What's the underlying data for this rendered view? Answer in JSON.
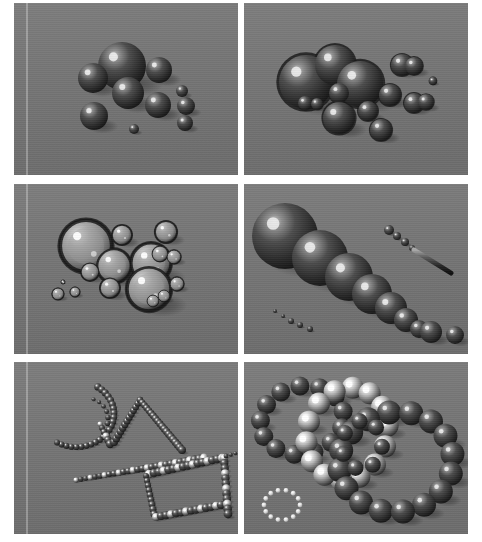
{
  "sheet": {
    "width": 482,
    "height": 542,
    "background": "#ffffff",
    "gutter_color": "#ffffff",
    "plate_color": "#767676",
    "plate_color_dark": "#6b6b6b",
    "rows": 3,
    "columns": 2,
    "caption": ""
  },
  "palette": {
    "background_gray": "#767676",
    "sphere_dark": "#2a2a2a",
    "sphere_mid": "#5a5a5a",
    "sphere_highlight": "#e8e8e8",
    "glass_rim": "#1e1e1e",
    "glass_body": "#8c8c8c",
    "shadow": "#4a4a4a",
    "bead_white": "#f0f0f0"
  },
  "panels": [
    {
      "id": "panel-1",
      "name": "opaque-spheres-cluster",
      "label": "",
      "x": 14,
      "y": 3,
      "w": 224,
      "h": 172,
      "edge_stripe_x": 12,
      "style": "opaque",
      "light": {
        "x": -0.35,
        "y": -0.45
      },
      "objects": [
        {
          "cx": 108,
          "cy": 63,
          "r": 24,
          "tone": "dark"
        },
        {
          "cx": 79,
          "cy": 75,
          "r": 15,
          "tone": "dark"
        },
        {
          "cx": 114,
          "cy": 90,
          "r": 16,
          "tone": "dark"
        },
        {
          "cx": 145,
          "cy": 67,
          "r": 13,
          "tone": "dark"
        },
        {
          "cx": 144,
          "cy": 102,
          "r": 13,
          "tone": "dark"
        },
        {
          "cx": 80,
          "cy": 113,
          "r": 14,
          "tone": "dark"
        },
        {
          "cx": 168,
          "cy": 88,
          "r": 6,
          "tone": "dark"
        },
        {
          "cx": 172,
          "cy": 103,
          "r": 9,
          "tone": "dark"
        },
        {
          "cx": 171,
          "cy": 120,
          "r": 8,
          "tone": "dark"
        },
        {
          "cx": 120,
          "cy": 126,
          "r": 5,
          "tone": "dark"
        }
      ]
    },
    {
      "id": "panel-2",
      "name": "merged-blobs-cluster",
      "label": "",
      "x": 244,
      "y": 3,
      "w": 224,
      "h": 172,
      "edge_stripe_x": -1,
      "style": "blobby",
      "light": {
        "x": -0.3,
        "y": -0.4
      },
      "objects": [
        {
          "cx": 62,
          "cy": 79,
          "r": 27,
          "tone": "dark"
        },
        {
          "cx": 91,
          "cy": 62,
          "r": 20,
          "tone": "dark"
        },
        {
          "cx": 116,
          "cy": 81,
          "r": 23,
          "tone": "dark"
        },
        {
          "cx": 95,
          "cy": 90,
          "r": 10,
          "tone": "dark"
        },
        {
          "cx": 61,
          "cy": 100,
          "r": 7,
          "tone": "dark"
        },
        {
          "cx": 73,
          "cy": 101,
          "r": 6,
          "tone": "dark"
        },
        {
          "cx": 95,
          "cy": 115,
          "r": 16,
          "tone": "dark"
        },
        {
          "cx": 124,
          "cy": 108,
          "r": 10,
          "tone": "dark"
        },
        {
          "cx": 137,
          "cy": 127,
          "r": 11,
          "tone": "dark"
        },
        {
          "cx": 146,
          "cy": 92,
          "r": 11,
          "tone": "dark"
        },
        {
          "cx": 158,
          "cy": 62,
          "r": 11,
          "tone": "dark"
        },
        {
          "cx": 170,
          "cy": 63,
          "r": 9,
          "tone": "dark"
        },
        {
          "cx": 170,
          "cy": 100,
          "r": 10,
          "tone": "dark"
        },
        {
          "cx": 182,
          "cy": 99,
          "r": 8,
          "tone": "dark"
        },
        {
          "cx": 189,
          "cy": 78,
          "r": 4,
          "tone": "dark"
        }
      ]
    },
    {
      "id": "panel-3",
      "name": "transparent-bubbles-cluster",
      "label": "",
      "x": 14,
      "y": 184,
      "w": 224,
      "h": 170,
      "edge_stripe_x": 12,
      "style": "glass",
      "light": {
        "x": -0.3,
        "y": -0.45
      },
      "objects": [
        {
          "cx": 72,
          "cy": 62,
          "r": 26,
          "tone": "glass"
        },
        {
          "cx": 100,
          "cy": 82,
          "r": 17,
          "tone": "glass"
        },
        {
          "cx": 76,
          "cy": 88,
          "r": 9,
          "tone": "glass"
        },
        {
          "cx": 96,
          "cy": 104,
          "r": 10,
          "tone": "glass"
        },
        {
          "cx": 137,
          "cy": 79,
          "r": 20,
          "tone": "glass"
        },
        {
          "cx": 135,
          "cy": 105,
          "r": 22,
          "tone": "glass"
        },
        {
          "cx": 108,
          "cy": 51,
          "r": 10,
          "tone": "glass"
        },
        {
          "cx": 152,
          "cy": 48,
          "r": 11,
          "tone": "glass"
        },
        {
          "cx": 146,
          "cy": 70,
          "r": 8,
          "tone": "glass"
        },
        {
          "cx": 160,
          "cy": 73,
          "r": 7,
          "tone": "glass"
        },
        {
          "cx": 163,
          "cy": 100,
          "r": 7,
          "tone": "glass"
        },
        {
          "cx": 150,
          "cy": 112,
          "r": 6,
          "tone": "glass"
        },
        {
          "cx": 139,
          "cy": 117,
          "r": 6,
          "tone": "glass"
        },
        {
          "cx": 44,
          "cy": 110,
          "r": 6,
          "tone": "glass"
        },
        {
          "cx": 61,
          "cy": 108,
          "r": 5,
          "tone": "glass"
        },
        {
          "cx": 49,
          "cy": 98,
          "r": 2,
          "tone": "glass"
        }
      ]
    },
    {
      "id": "panel-4",
      "name": "tapered-sphere-chain",
      "label": "",
      "x": 244,
      "y": 184,
      "w": 224,
      "h": 170,
      "edge_stripe_x": -1,
      "style": "opaque",
      "light": {
        "x": -0.3,
        "y": -0.45
      },
      "objects": [
        {
          "cx": 41,
          "cy": 52,
          "r": 33,
          "tone": "dark"
        },
        {
          "cx": 76,
          "cy": 74,
          "r": 28,
          "tone": "dark"
        },
        {
          "cx": 105,
          "cy": 93,
          "r": 24,
          "tone": "dark"
        },
        {
          "cx": 128,
          "cy": 110,
          "r": 20,
          "tone": "dark"
        },
        {
          "cx": 147,
          "cy": 124,
          "r": 16,
          "tone": "dark"
        },
        {
          "cx": 162,
          "cy": 136,
          "r": 12,
          "tone": "dark"
        },
        {
          "cx": 175,
          "cy": 145,
          "r": 9,
          "tone": "dark"
        },
        {
          "cx": 187,
          "cy": 148,
          "r": 11,
          "tone": "dark"
        },
        {
          "cx": 211,
          "cy": 151,
          "r": 9,
          "tone": "dark"
        },
        {
          "cx": 145,
          "cy": 46,
          "r": 5,
          "tone": "dark"
        },
        {
          "cx": 153,
          "cy": 52,
          "r": 4,
          "tone": "dark"
        },
        {
          "cx": 161,
          "cy": 58,
          "r": 4,
          "tone": "dark"
        },
        {
          "cx": 168,
          "cy": 64,
          "r": 3,
          "tone": "dark"
        },
        {
          "cx": 31,
          "cy": 127,
          "r": 2,
          "tone": "dark"
        },
        {
          "cx": 39,
          "cy": 132,
          "r": 2,
          "tone": "dark"
        },
        {
          "cx": 47,
          "cy": 137,
          "r": 3,
          "tone": "dark"
        },
        {
          "cx": 56,
          "cy": 141,
          "r": 3,
          "tone": "dark"
        },
        {
          "cx": 66,
          "cy": 145,
          "r": 3,
          "tone": "dark"
        }
      ],
      "rod": {
        "x1": 170,
        "y1": 66,
        "x2": 207,
        "y2": 89,
        "width": 5
      }
    },
    {
      "id": "panel-5",
      "name": "particle-trail-wireframe",
      "label": "",
      "x": 14,
      "y": 362,
      "w": 224,
      "h": 172,
      "edge_stripe_x": 12,
      "style": "beads",
      "light": {
        "x": -0.4,
        "y": -0.4
      },
      "paths": [
        {
          "name": "arc-left",
          "type": "arc",
          "cx": 62,
          "cy": 52,
          "rx": 38,
          "ry": 33,
          "a0": -55,
          "a1": 120,
          "count": 24,
          "r0": 3.6,
          "r1": 3.0,
          "tone": "dark"
        },
        {
          "name": "dash-inner",
          "type": "arc",
          "cx": 72,
          "cy": 57,
          "rx": 22,
          "ry": 21,
          "a0": -70,
          "a1": 12,
          "count": 6,
          "r0": 2.0,
          "r1": 2.8,
          "tone": "dark"
        },
        {
          "name": "spur-left",
          "type": "line",
          "x1": 86,
          "y1": 62,
          "x2": 96,
          "y2": 82,
          "count": 6,
          "r0": 2.6,
          "r1": 4.2,
          "tone": "mixed"
        },
        {
          "name": "ridge-up",
          "type": "line",
          "x1": 100,
          "y1": 80,
          "x2": 126,
          "y2": 38,
          "count": 13,
          "r0": 4.0,
          "r1": 3.2,
          "tone": "dark"
        },
        {
          "name": "ridge-down",
          "type": "line",
          "x1": 126,
          "y1": 38,
          "x2": 168,
          "y2": 88,
          "count": 20,
          "r0": 3.2,
          "r1": 4.0,
          "tone": "dark"
        },
        {
          "name": "long-diag",
          "type": "line",
          "x1": 62,
          "y1": 118,
          "x2": 190,
          "y2": 96,
          "count": 28,
          "r0": 2.6,
          "r1": 4.4,
          "tone": "mixed"
        },
        {
          "name": "box-top",
          "type": "line",
          "x1": 135,
          "y1": 112,
          "x2": 208,
          "y2": 96,
          "count": 16,
          "r0": 4.2,
          "r1": 4.2,
          "tone": "mixed"
        },
        {
          "name": "box-left",
          "type": "line",
          "x1": 132,
          "y1": 114,
          "x2": 140,
          "y2": 152,
          "count": 9,
          "r0": 3.0,
          "r1": 3.6,
          "tone": "dark"
        },
        {
          "name": "box-bottom",
          "type": "line",
          "x1": 142,
          "y1": 155,
          "x2": 212,
          "y2": 142,
          "count": 15,
          "r0": 4.0,
          "r1": 4.2,
          "tone": "mixed"
        },
        {
          "name": "box-right",
          "type": "line",
          "x1": 210,
          "y1": 96,
          "x2": 214,
          "y2": 152,
          "count": 12,
          "r0": 4.0,
          "r1": 4.4,
          "tone": "mixed"
        },
        {
          "name": "tail-right",
          "type": "line",
          "x1": 212,
          "y1": 94,
          "x2": 226,
          "y2": 90,
          "count": 4,
          "r0": 2.4,
          "r1": 1.6,
          "tone": "dark"
        }
      ]
    },
    {
      "id": "panel-6",
      "name": "interlocking-sphere-rings",
      "label": "",
      "x": 244,
      "y": 362,
      "w": 224,
      "h": 172,
      "edge_stripe_x": -1,
      "style": "rings",
      "light": {
        "x": -0.4,
        "y": -0.4
      },
      "rings": [
        {
          "name": "ring-back-left",
          "cx": 58,
          "cy": 58,
          "rx": 42,
          "ry": 34,
          "rot": -12,
          "count": 13,
          "r": 9.5,
          "tone": "dark"
        },
        {
          "name": "ring-bright-mid",
          "cx": 103,
          "cy": 72,
          "rx": 40,
          "ry": 47,
          "rot": 18,
          "count": 14,
          "r": 11,
          "tone": "bright"
        },
        {
          "name": "ring-front-right",
          "cx": 152,
          "cy": 100,
          "rx": 57,
          "ry": 50,
          "rot": -8,
          "count": 16,
          "r": 12,
          "tone": "dark"
        },
        {
          "name": "ring-center-small",
          "cx": 118,
          "cy": 83,
          "rx": 20,
          "ry": 24,
          "rot": 5,
          "count": 7,
          "r": 8,
          "tone": "dark"
        },
        {
          "name": "ring-beads-tiny",
          "cx": 38,
          "cy": 143,
          "rx": 18,
          "ry": 15,
          "rot": 0,
          "count": 14,
          "r": 2.4,
          "tone": "white"
        }
      ]
    }
  ]
}
